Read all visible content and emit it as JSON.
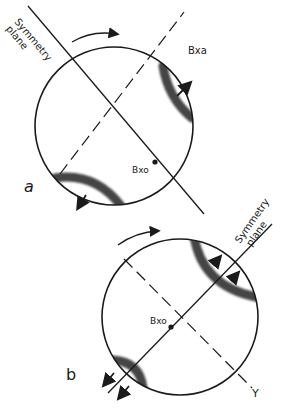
{
  "figure_a": {
    "panel_label": "a",
    "symmetry_plane_label": "Symmetry plane",
    "symmetry_plane_line1": "Symmetry",
    "symmetry_plane_line2": "plane",
    "bxa_label": "Bxa",
    "bxo_label": "Bxo",
    "rotation_arrow": "clockwise"
  },
  "figure_b": {
    "panel_label": "b",
    "symmetry_plane_line1": "Symmetry",
    "symmetry_plane_line2": "plane",
    "bxo_label": "Bxo",
    "y_label": "Y",
    "rotation_arrow": "clockwise"
  },
  "colors": {
    "ink": "#1a1a1a",
    "isogyre": "#4a4a4a"
  }
}
